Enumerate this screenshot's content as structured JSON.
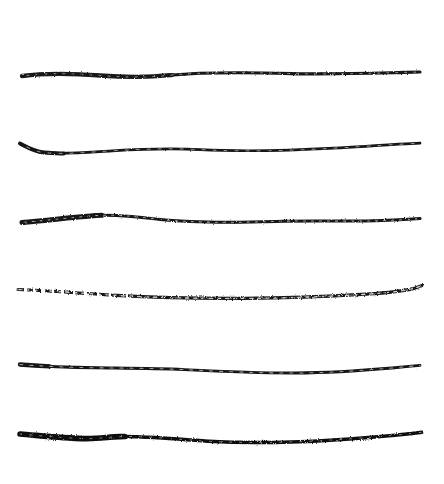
{
  "artwork": {
    "title": "Six hand-drawn horizontal ink strokes",
    "medium": "ink brush / marker on paper",
    "background_color": "#ffffff",
    "ink_color": "#141414",
    "canvas": {
      "width": 444,
      "height": 484
    },
    "stroke_count": 6,
    "orientation": "horizontal",
    "strokes": [
      {
        "index": 1,
        "name": "stroke-1",
        "description": "nearly straight line, slight dip at left shoulder, thins toward right tail",
        "start_x": 22,
        "end_x": 420,
        "baseline_y": 74,
        "thickness_start": 4.2,
        "thickness_mid": 3.0,
        "thickness_end": 2.0,
        "ink_color": "#141414",
        "opacity": 1,
        "path": "M22,76 C48,72.5 74,73.5 100,75.5 C124,77.4 146,77.8 170,75.2 C208,71.6 250,72.4 292,73.6 C330,74.6 372,73.2 404,72.4 L420,72.0",
        "texture": "grainy-medium"
      },
      {
        "index": 2,
        "name": "stroke-2",
        "description": "pronounced downward hook at left entry, then long flat rise to a thin right tail",
        "start_x": 20,
        "end_x": 420,
        "baseline_y": 148,
        "thickness_start": 3.6,
        "thickness_mid": 2.6,
        "thickness_end": 1.8,
        "ink_color": "#141414",
        "opacity": 1,
        "path": "M20,143.5 C26,146.6 34,151.4 44,152.6 C62,154.6 86,152.4 112,150.8 C146,148.8 174,148.2 200,149.6 C246,152.0 290,150.6 334,148.2 C368,146.2 398,144.2 420,143.2",
        "texture": "grainy-fine"
      },
      {
        "index": 3,
        "name": "stroke-3",
        "description": "heavy blunt left head, gentle hump near left third, long level body, thin right end",
        "start_x": 22,
        "end_x": 420,
        "baseline_y": 219,
        "thickness_start": 5.0,
        "thickness_mid": 3.0,
        "thickness_end": 2.2,
        "ink_color": "#141414",
        "opacity": 1,
        "path": "M22,222.5 C50,220.0 72,217.4 96,215.6 C116,214.2 136,216.6 158,219.2 C196,223.2 236,222.6 276,221.4 C312,220.4 348,221.8 382,220.6 C400,219.9 412,219.2 420,218.6",
        "texture": "grainy-medium"
      },
      {
        "index": 4,
        "name": "stroke-4",
        "description": "dry broken left start with gaps, shallow sag through the middle, upward flick at right tip",
        "start_x": 18,
        "end_x": 422,
        "baseline_y": 291,
        "thickness_start": 2.4,
        "thickness_mid": 3.2,
        "thickness_end": 2.0,
        "ink_color": "#141414",
        "opacity": 1,
        "path": "M18,289.5 C48,290.6 82,293.2 116,295.4 C156,297.8 200,298.6 244,298.4 C288,298.2 330,296.4 366,294.2 C388,292.8 404,291.0 414,288.4 L422,285.6",
        "texture": "dry-brush"
      },
      {
        "index": 5,
        "name": "stroke-5",
        "description": "thick blunt left head tapering quickly, slight sag mid-span, rises to thin right tail",
        "start_x": 20,
        "end_x": 420,
        "baseline_y": 367,
        "thickness_start": 4.4,
        "thickness_mid": 2.8,
        "thickness_end": 1.8,
        "ink_color": "#141414",
        "opacity": 1,
        "path": "M20,364.5 C42,366.2 68,367.4 96,367.8 C128,368.2 156,368.2 184,369.6 C220,371.4 258,373.2 296,373.0 C332,372.8 364,370.4 392,368.0 C406,366.8 414,366.0 420,365.4",
        "texture": "grainy-fine"
      },
      {
        "index": 6,
        "name": "stroke-6",
        "description": "boldest and darkest stroke, thick wedge head with bump near left quarter, tapers to right",
        "start_x": 20,
        "end_x": 422,
        "baseline_y": 437,
        "thickness_start": 5.6,
        "thickness_mid": 3.4,
        "thickness_end": 2.2,
        "ink_color": "#0e0e0e",
        "opacity": 1,
        "path": "M20,434.0 C40,435.6 62,438.0 84,438.6 C98,439.0 108,437.0 120,436.6 C146,435.8 176,439.4 208,441.2 C248,443.4 288,442.6 326,440.4 C360,438.4 392,435.6 412,433.4 L422,432.2",
        "texture": "grainy-bold"
      }
    ]
  }
}
